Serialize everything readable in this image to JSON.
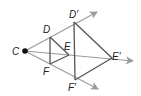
{
  "diagram": {
    "colors": {
      "ray": "#9a9a9a",
      "segment": "#555555",
      "point": "#111111",
      "label": "#222222"
    },
    "center": {
      "label": "C",
      "x": 25,
      "y": 51
    },
    "points": [
      {
        "label": "D",
        "x": 50,
        "y": 37,
        "lx": 43,
        "ly": 33
      },
      {
        "label": "E",
        "x": 69,
        "y": 55,
        "lx": 64,
        "ly": 49
      },
      {
        "label": "F",
        "x": 50,
        "y": 64,
        "lx": 43,
        "ly": 75
      },
      {
        "label": "D′",
        "x": 74,
        "y": 22,
        "lx": 69,
        "ly": 18
      },
      {
        "label": "E′",
        "x": 112,
        "y": 58,
        "lx": 112,
        "ly": 59
      },
      {
        "label": "F′",
        "x": 75,
        "y": 80,
        "lx": 68,
        "ly": 91
      }
    ],
    "rays": [
      {
        "from": "C",
        "through": "D′",
        "x2": 97,
        "y2": 12
      },
      {
        "from": "C",
        "through": "E′",
        "x2": 133,
        "y2": 61
      },
      {
        "from": "C",
        "through": "F′",
        "x2": 98,
        "y2": 89
      }
    ],
    "triangles": [
      {
        "name": "DEF",
        "vertices": [
          "D",
          "E",
          "F"
        ]
      },
      {
        "name": "D′E′F′",
        "vertices": [
          "D′",
          "E′",
          "F′"
        ]
      }
    ],
    "labels": {
      "C": "C",
      "D": "D",
      "E": "E",
      "F": "F",
      "Dp": "D′",
      "Ep": "E′",
      "Fp": "F′"
    }
  }
}
